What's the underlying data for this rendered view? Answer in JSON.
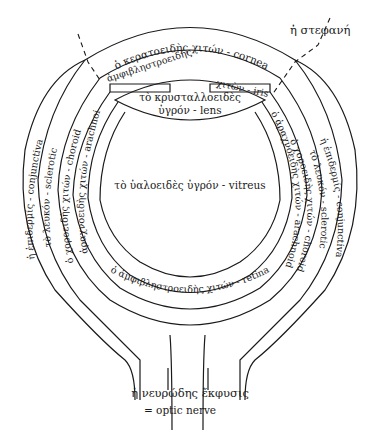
{
  "diagram": {
    "labels": {
      "cornea": "ὁ κερατοειδὴς χιτών - cornea",
      "stephane": "ἡ στεφανή",
      "amphiblestroeides_top": "ἀμφιβληστροειδής",
      "iris": "χιτὼν - iris",
      "lens_line1": "τὸ κρυσταλλοειδὲς",
      "lens_line2": "ὑγρόν - lens",
      "conjunctiva_left": "ἡ ἐπιδερμίς - conjunctiva",
      "sclerotic_left": "τὸ λευκόν - sclerotic",
      "choroid_left": "ὁ χοροειδὴς χιτών - choroid",
      "arachnoid_left": "ὁ ἀραχνοειδὴς χιτών - arachnoid",
      "conjunctiva_right": "ἡ ἐπιδερμίς - conjunctiva",
      "sclerotic_right": "τὸ λευκόν - sclerotic",
      "choroid_right": "ὁ χοροειδὴς χιτών - choroid",
      "arachnoid_right": "ὁ ἀραχνοειδὴς χιτών - arachnoid",
      "vitreous": "τὸ ὑαλοειδὲς ὑγρόν - vitreus",
      "retina": "ὁ ἀμφιβληστροειδὴς χιτών - retina",
      "optic_line1": "ἡ νευρώδης ἔκφυσις",
      "optic_line2": "= optic nerve"
    }
  }
}
